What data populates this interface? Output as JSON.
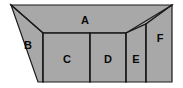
{
  "figure": {
    "name": "labeled-3d-block-net",
    "type": "geometric-solid-diagram",
    "background_color": "#ffffff",
    "face_fill_color": "#a8a8a8",
    "edge_color": "#1a1a1a",
    "label_color": "#0a0a0a",
    "outline": {
      "vertices": [
        [
          11,
          5
        ],
        [
          172,
          5
        ],
        [
          172,
          82
        ],
        [
          38,
          82
        ]
      ],
      "description": "hexagonal outline of an extruded block seen in oblique projection"
    },
    "faces": [
      {
        "id": "A",
        "label": "A",
        "role": "top-face",
        "label_x": 85,
        "label_y": 20,
        "polygon": "11,5 172,5 146,24 127,33 43,33"
      },
      {
        "id": "B",
        "label": "B",
        "role": "left-face",
        "label_x": 28,
        "label_y": 45,
        "polygon": "11,5 43,33 43,82 38,82 11,5"
      },
      {
        "id": "C",
        "label": "C",
        "role": "front-face-1",
        "label_x": 67,
        "label_y": 59,
        "polygon": "43,33 90,33 90,82 43,82"
      },
      {
        "id": "D",
        "label": "D",
        "role": "front-face-2",
        "label_x": 108,
        "label_y": 59,
        "polygon": "90,33 126,33 126,82 90,82"
      },
      {
        "id": "E",
        "label": "E",
        "role": "front-face-3",
        "label_x": 136,
        "label_y": 59,
        "polygon": "126,33 146,24 146,82 126,82"
      },
      {
        "id": "F",
        "label": "F",
        "role": "right-face",
        "label_x": 160,
        "label_y": 38,
        "polygon": "146,24 172,5 172,82 146,82"
      }
    ],
    "interior_edges": [
      {
        "name": "edge-b-c",
        "x1": 43,
        "y1": 33,
        "x2": 43,
        "y2": 82
      },
      {
        "name": "edge-c-d",
        "x1": 90,
        "y1": 33,
        "x2": 90,
        "y2": 82
      },
      {
        "name": "edge-d-e",
        "x1": 126,
        "y1": 33,
        "x2": 126,
        "y2": 82
      },
      {
        "name": "edge-e-f",
        "x1": 146,
        "y1": 24,
        "x2": 146,
        "y2": 82
      },
      {
        "name": "edge-top-left-diagonal",
        "x1": 11,
        "y1": 5,
        "x2": 43,
        "y2": 33
      },
      {
        "name": "edge-top-front-horizontal",
        "x1": 43,
        "y1": 33,
        "x2": 126,
        "y2": 33
      },
      {
        "name": "edge-top-right-diagonal",
        "x1": 126,
        "y1": 33,
        "x2": 172,
        "y2": 5
      }
    ]
  }
}
